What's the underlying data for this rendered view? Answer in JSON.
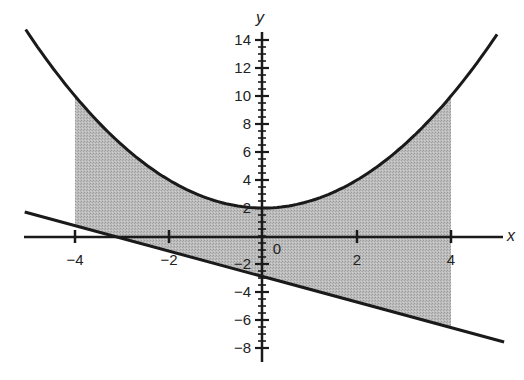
{
  "chart_data": {
    "type": "area",
    "title": "",
    "xlabel": "x",
    "ylabel": "y",
    "xlim": [
      -5.6,
      5.3
    ],
    "ylim": [
      -8.8,
      15
    ],
    "grid": false,
    "legend": null,
    "x_ticks": [
      -4,
      -2,
      0,
      2,
      4
    ],
    "x_tick_labels": [
      "−4",
      "−2",
      "0",
      "2",
      "4"
    ],
    "y_ticks": [
      -8,
      -6,
      -4,
      -2,
      2,
      4,
      6,
      8,
      10,
      12,
      14
    ],
    "y_tick_labels": [
      "−8",
      "−6",
      "−4",
      "−2",
      "2",
      "4",
      "6",
      "8",
      "10",
      "12",
      "14"
    ],
    "y_minor_tick_step": 0.5,
    "series": [
      {
        "name": "parabola",
        "equation": "y = x^2/2 + 2",
        "x_range": [
          -5.05,
          4.98
        ],
        "points": [
          [
            -5,
            14.5
          ],
          [
            -4,
            10
          ],
          [
            -2,
            4
          ],
          [
            0,
            2
          ],
          [
            2,
            4
          ],
          [
            4,
            10
          ],
          [
            5,
            14.5
          ]
        ]
      },
      {
        "name": "line",
        "equation": "y = -0.91x - 2.9",
        "x_range": [
          -5.07,
          5.13
        ],
        "points": [
          [
            -5,
            1.65
          ],
          [
            -4,
            0.74
          ],
          [
            0,
            -2.9
          ],
          [
            4,
            -6.54
          ],
          [
            5,
            -7.45
          ]
        ]
      }
    ],
    "shaded_region": {
      "between": [
        "parabola",
        "line"
      ],
      "x_from": -4,
      "x_to": 4,
      "color": "#b3b3b3"
    }
  },
  "colors": {
    "curve": "#1a1a1a",
    "shade": "#b3b3b3",
    "background": "#ffffff"
  }
}
